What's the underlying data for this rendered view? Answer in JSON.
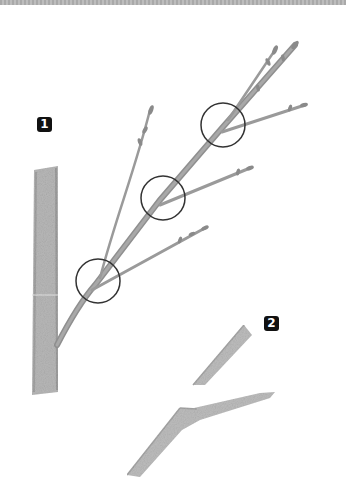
{
  "figure": {
    "labels": [
      {
        "id": "1",
        "text": "1"
      },
      {
        "id": "2",
        "text": "2"
      }
    ],
    "colors": {
      "branch": "#9a9a9a",
      "branch_dark": "#7d7d7d",
      "trunk": "#b5b5b5",
      "circle_outline": "#333333",
      "badge_bg": "#111111",
      "badge_text": "#ffffff",
      "stripe": "#b0b0b0"
    },
    "highlight_circles": [
      {
        "cx": 98,
        "cy": 281,
        "r": 22
      },
      {
        "cx": 163,
        "cy": 198,
        "r": 22
      },
      {
        "cx": 223,
        "cy": 125,
        "r": 22
      }
    ]
  }
}
